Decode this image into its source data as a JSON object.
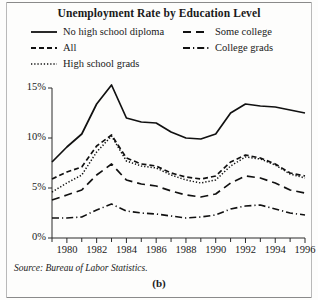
{
  "figure": {
    "panel_label": "(b)",
    "source_note": "Source: Bureau of Labor Statistics."
  },
  "chart_data": {
    "type": "line",
    "title": "Unemployment Rate by Education Level",
    "xlabel": "",
    "ylabel": "",
    "xlim": [
      1979,
      1996
    ],
    "ylim": [
      0,
      15
    ],
    "grid": false,
    "legend_position": "top",
    "x": [
      1979,
      1980,
      1981,
      1982,
      1983,
      1984,
      1985,
      1986,
      1987,
      1988,
      1989,
      1990,
      1991,
      1992,
      1993,
      1994,
      1995,
      1996
    ],
    "xticks": [
      1980,
      1982,
      1984,
      1986,
      1988,
      1990,
      1992,
      1994,
      1996
    ],
    "xtick_labels": [
      "1980",
      "1982",
      "1984",
      "1986",
      "1988",
      "1990",
      "1992",
      "1994",
      "1996"
    ],
    "xminor_ticks": [
      1979,
      1981,
      1983,
      1985,
      1987,
      1989,
      1991,
      1993,
      1995
    ],
    "yticks": [
      0,
      5,
      10,
      15
    ],
    "ytick_labels": [
      "0%",
      "5%",
      "10%",
      "15%"
    ],
    "series": [
      {
        "name": "No high school diploma",
        "style": "solid",
        "color": "#111111",
        "values": [
          7.6,
          9.1,
          10.4,
          13.4,
          15.3,
          12.0,
          11.6,
          11.5,
          10.6,
          10.0,
          9.9,
          10.4,
          12.5,
          13.4,
          13.2,
          13.1,
          12.8,
          12.5
        ]
      },
      {
        "name": "All",
        "style": "dashed",
        "color": "#111111",
        "values": [
          5.9,
          6.6,
          7.1,
          9.2,
          10.3,
          8.0,
          7.4,
          7.2,
          6.5,
          6.1,
          5.9,
          6.2,
          7.6,
          8.3,
          8.0,
          7.4,
          6.5,
          6.2
        ]
      },
      {
        "name": "High school grads",
        "style": "dotted",
        "color": "#111111",
        "values": [
          4.6,
          5.5,
          6.3,
          8.6,
          10.2,
          7.7,
          7.2,
          7.0,
          6.3,
          5.8,
          5.5,
          5.8,
          7.2,
          8.1,
          7.9,
          7.3,
          6.4,
          6.0
        ]
      },
      {
        "name": "Some college",
        "style": "longdash",
        "color": "#111111",
        "values": [
          3.8,
          4.3,
          4.8,
          6.3,
          7.4,
          5.8,
          5.4,
          5.2,
          4.7,
          4.3,
          4.1,
          4.4,
          5.5,
          6.2,
          6.0,
          5.5,
          4.8,
          4.5
        ]
      },
      {
        "name": "College grads",
        "style": "dashdot",
        "color": "#111111",
        "values": [
          2.0,
          2.0,
          2.1,
          2.8,
          3.4,
          2.7,
          2.5,
          2.4,
          2.2,
          2.0,
          2.1,
          2.3,
          2.9,
          3.2,
          3.3,
          2.9,
          2.5,
          2.3
        ]
      }
    ]
  }
}
